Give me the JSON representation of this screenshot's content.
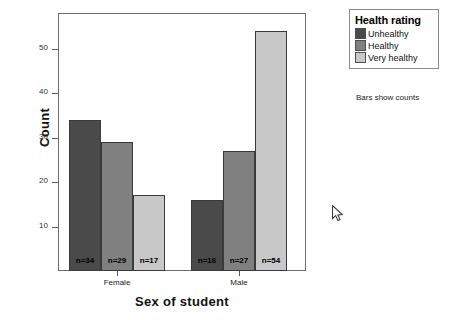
{
  "chart_data": {
    "type": "bar",
    "title": "",
    "xlabel": "Sex of student",
    "ylabel": "Count",
    "categories": [
      "Female",
      "Male"
    ],
    "series": [
      {
        "name": "Unhealthy",
        "values": [
          34,
          16
        ],
        "color": "#4a4a4a"
      },
      {
        "name": "Healthy",
        "values": [
          29,
          27
        ],
        "color": "#808080"
      },
      {
        "name": "Very healthy",
        "values": [
          17,
          54
        ],
        "color": "#c8c8c8"
      }
    ],
    "bar_labels": [
      [
        "n=34",
        "n=29",
        "n=17"
      ],
      [
        "n=16",
        "n=27",
        "n=54"
      ]
    ],
    "yticks": [
      10,
      20,
      30,
      40,
      50
    ],
    "ytick_labels": [
      "10",
      "20",
      "30",
      "40",
      "50"
    ],
    "ylim": [
      0,
      58
    ],
    "grid": false,
    "legend": {
      "title": "Health rating",
      "position": "right-top",
      "entries": [
        "Unhealthy",
        "Healthy",
        "Very healthy"
      ]
    },
    "annotations": [
      "Bars show counts"
    ]
  },
  "legend": {
    "title": "Health rating",
    "items": [
      {
        "label": "Unhealthy",
        "color": "#4a4a4a"
      },
      {
        "label": "Healthy",
        "color": "#808080"
      },
      {
        "label": "Very healthy",
        "color": "#c8c8c8"
      }
    ]
  },
  "footnote": "Bars show counts",
  "axes": {
    "y_title": "Count",
    "x_title": "Sex of student"
  },
  "cursor": {
    "icon": "mouse-pointer-icon"
  }
}
